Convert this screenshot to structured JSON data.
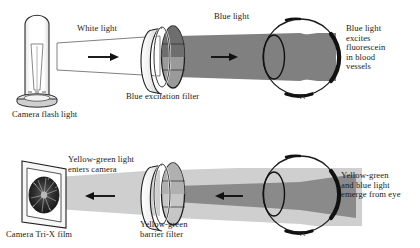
{
  "diagram": {
    "colors": {
      "ink": "#1a1a1a",
      "white_beam_fill": "#ffffff",
      "white_beam_stroke": "#3c3c3c",
      "blue_beam": "#808080",
      "yellow_green_beam": "#c9c9c9",
      "filter_rim": "#f2f2f2",
      "filter_glass_top": "#6e6e6e",
      "filter_glass_bottom": "#9a9a9a",
      "barrier_glass": "#bdbdbd",
      "lamp_body": "#ffffff",
      "lamp_base": "#d8d8d8",
      "film_frame": "#f4f4f4",
      "fundus": "#2a2a2a",
      "background": "#ffffff"
    },
    "panels": [
      {
        "id": "top-panel",
        "name": "illumination-path",
        "labels": [
          {
            "id": "camera-flash-light",
            "text": "Camera flash light",
            "x": 12,
            "y": 110,
            "size": 9.0
          },
          {
            "id": "white-light",
            "text": "White light",
            "x": 77,
            "y": 28,
            "size": 9.0
          },
          {
            "id": "blue-light",
            "text": "Blue light",
            "x": 214,
            "y": 14,
            "size": 9.0
          },
          {
            "id": "blue-excitation-filter",
            "text": "Blue excitation filter",
            "x": 128,
            "y": 93,
            "size": 9.0
          },
          {
            "id": "blue-light-excites-fluorescein",
            "text": "Blue light\nexcites\nfluorescein\nin blood\nvessels",
            "x": 346,
            "y": 25,
            "size": 9.0
          }
        ]
      },
      {
        "id": "bottom-panel",
        "name": "imaging-path",
        "labels": [
          {
            "id": "camera-tri-x-film",
            "text": "Camera Tri-X film",
            "x": 6,
            "y": 231,
            "size": 9.0
          },
          {
            "id": "yellow-green-light-enters-camera",
            "text": "Yellow-green light\nenters camera",
            "x": 68,
            "y": 157,
            "size": 9.0
          },
          {
            "id": "yellow-green-barrier-filter",
            "text": "Yellow-green\nbarrier filter",
            "x": 140,
            "y": 222,
            "size": 9.0
          },
          {
            "id": "yellow-green-and-blue-light-emerge",
            "text": "Yellow-green\nand blue light\nemerge from eye",
            "x": 341,
            "y": 172,
            "size": 9.0
          }
        ]
      }
    ],
    "objects": [
      {
        "id": "flash-lamp",
        "name": "camera-flash-lamp",
        "panel": "top"
      },
      {
        "id": "white-beam",
        "name": "white-light-beam",
        "panel": "top",
        "direction": "right"
      },
      {
        "id": "excitation-filter",
        "name": "blue-excitation-filter-disc",
        "panel": "top"
      },
      {
        "id": "blue-beam",
        "name": "blue-light-beam",
        "panel": "top",
        "direction": "right"
      },
      {
        "id": "eye-top",
        "name": "eye-illustration",
        "panel": "top"
      },
      {
        "id": "film",
        "name": "tri-x-film-holder",
        "panel": "bottom"
      },
      {
        "id": "yg-beam",
        "name": "yellow-green-light-beam",
        "panel": "bottom",
        "direction": "left"
      },
      {
        "id": "barrier-filter",
        "name": "yellow-green-barrier-filter-disc",
        "panel": "bottom"
      },
      {
        "id": "mixed-beam",
        "name": "yellow-green-and-blue-beam",
        "panel": "bottom",
        "direction": "left"
      },
      {
        "id": "eye-bottom",
        "name": "eye-illustration",
        "panel": "bottom"
      }
    ],
    "arrows": [
      {
        "id": "arrow-top",
        "name": "flow-arrow-right",
        "direction": "right",
        "x": 95,
        "y": 57
      },
      {
        "id": "arrow-blue",
        "name": "flow-arrow-right",
        "direction": "right",
        "x": 218,
        "y": 57
      },
      {
        "id": "arrow-bottom",
        "name": "flow-arrow-left",
        "direction": "left",
        "x": 95,
        "y": 196
      },
      {
        "id": "arrow-mixed",
        "name": "flow-arrow-left",
        "direction": "left",
        "x": 222,
        "y": 196
      }
    ]
  }
}
